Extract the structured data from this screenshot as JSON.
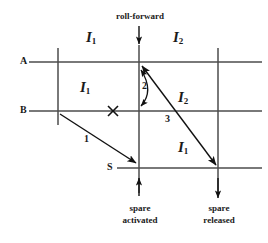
{
  "diagram": {
    "type": "timeline-interval-diagram",
    "colors": {
      "line": "#4d4d4d",
      "arrow": "#111111",
      "text": "#1a1a1a",
      "background": "#ffffff"
    },
    "timelines": [
      {
        "id": "A",
        "label": "A",
        "y": 62
      },
      {
        "id": "B",
        "label": "B",
        "y": 111
      },
      {
        "id": "S",
        "label": "S",
        "y": 168
      }
    ],
    "vertical_markers": [
      {
        "id": "left",
        "x": 58,
        "from_y": 48,
        "to_y": 125
      },
      {
        "id": "middle",
        "x": 139,
        "from_y": 45,
        "to_y": 193
      },
      {
        "id": "right",
        "x": 218,
        "from_y": 48,
        "to_y": 193
      }
    ],
    "interval_labels": [
      {
        "id": "a-left",
        "text": "I",
        "sub": "1",
        "x": 86,
        "y": 38
      },
      {
        "id": "a-right",
        "text": "I",
        "sub": "2",
        "x": 173,
        "y": 38
      },
      {
        "id": "b-left",
        "text": "I",
        "sub": "1",
        "x": 80,
        "y": 88
      },
      {
        "id": "b-right",
        "text": "I",
        "sub": "2",
        "x": 178,
        "y": 98
      },
      {
        "id": "s-right",
        "text": "I",
        "sub": "1",
        "x": 178,
        "y": 148
      }
    ],
    "arrow_numbers": [
      {
        "id": "arrow-1-number",
        "text": "1",
        "x": 88,
        "y": 139
      },
      {
        "id": "arrow-2-number",
        "text": "2",
        "x": 144,
        "y": 86
      },
      {
        "id": "arrow-3-number",
        "text": "3",
        "x": 167,
        "y": 118
      }
    ],
    "events": [
      {
        "id": "roll-forward",
        "label_line1": "roll-forward",
        "label_line2": "",
        "x": 139,
        "position": "top",
        "arrow_direction": "down"
      },
      {
        "id": "spare-activated",
        "label_line1": "spare",
        "label_line2": "activated",
        "x": 139,
        "position": "bottom",
        "arrow_direction": "up"
      },
      {
        "id": "spare-released",
        "label_line1": "spare",
        "label_line2": "released",
        "x": 218,
        "position": "bottom",
        "arrow_direction": "down"
      }
    ],
    "failure_mark": {
      "id": "failure-x",
      "symbol": "×",
      "x": 113,
      "y": 111
    }
  }
}
